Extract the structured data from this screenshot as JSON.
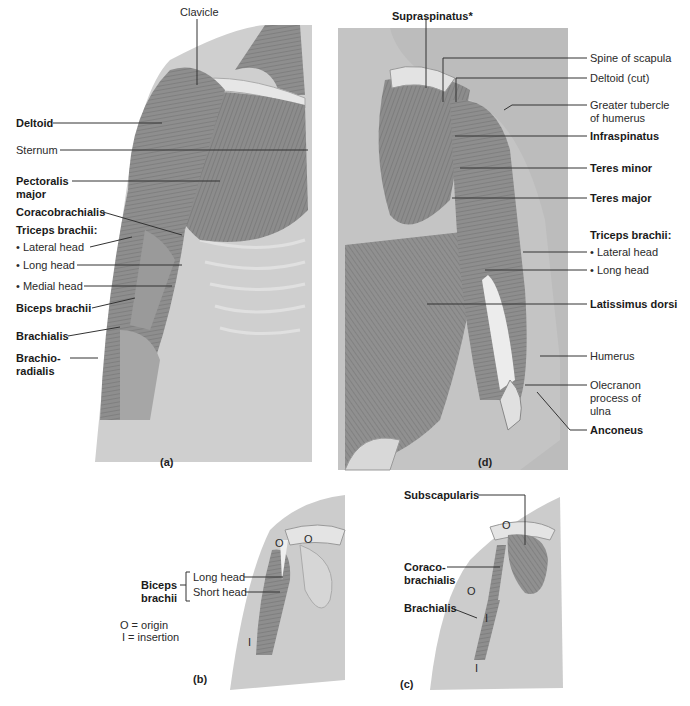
{
  "figure": {
    "panels": {
      "a": {
        "letter": "(a)",
        "labels": {
          "clavicle": "Clavicle",
          "deltoid": "Deltoid",
          "sternum": "Sternum",
          "pectoralis_1": "Pectoralis",
          "pectoralis_2": "major",
          "coracobrachialis": "Coracobrachialis",
          "triceps": "Triceps brachii:",
          "lateral_head": "• Lateral head",
          "long_head": "• Long head",
          "medial_head": "• Medial head",
          "biceps": "Biceps brachii",
          "brachialis": "Brachialis",
          "brachioradialis_1": "Brachio-",
          "brachioradialis_2": "radialis"
        }
      },
      "b": {
        "letter": "(b)",
        "labels": {
          "biceps_1": "Biceps",
          "biceps_2": "brachii",
          "long_head": "Long head",
          "short_head": "Short head",
          "origin_key": "O = origin",
          "insertion_key": "I  = insertion",
          "o_mark": "O",
          "i_mark": "I"
        }
      },
      "c": {
        "letter": "(c)",
        "labels": {
          "subscapularis": "Subscapularis",
          "coraco_1": "Coraco-",
          "coraco_2": "brachialis",
          "brachialis": "Brachialis",
          "o_mark": "O",
          "i_mark": "I"
        }
      },
      "d": {
        "letter": "(d)",
        "labels": {
          "supraspinatus": "Supraspinatus*",
          "spine_scapula": "Spine of scapula",
          "deltoid_cut": "Deltoid (cut)",
          "greater_tubercle_1": "Greater tubercle",
          "greater_tubercle_2": "of humerus",
          "infraspinatus": "Infraspinatus",
          "teres_minor": "Teres minor",
          "teres_major": "Teres major",
          "triceps": "Triceps brachii:",
          "lateral_head": "• Lateral head",
          "long_head": "• Long head",
          "latissimus": "Latissimus dorsi",
          "humerus": "Humerus",
          "olecranon_1": "Olecranon",
          "olecranon_2": "process of",
          "olecranon_3": "ulna",
          "anconeus": "Anconeus"
        }
      }
    },
    "colors": {
      "muscle": "#8a8a8a",
      "muscle_dark": "#6e6e6e",
      "skin": "#c9c9c9",
      "bone": "#e4e4e4",
      "panel_bg": "#bdbdbd",
      "leader": "#333333"
    }
  }
}
